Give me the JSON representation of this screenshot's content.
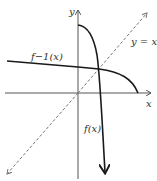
{
  "diagram": {
    "labels": {
      "y_axis": "y",
      "x_axis": "x",
      "line": "y = x",
      "inverse": "f−1(x)",
      "function": "f(x)"
    },
    "colors": {
      "curve": "#1a1a1a",
      "axis": "#555555",
      "dashed": "#777777"
    }
  }
}
